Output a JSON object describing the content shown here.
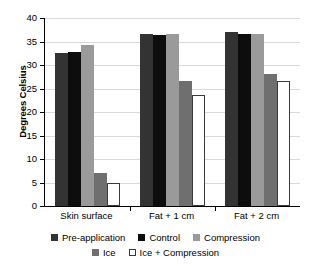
{
  "chart_data": {
    "type": "bar",
    "title": "",
    "xlabel": "",
    "ylabel": "Degrees Celsius",
    "ylim": [
      0,
      40
    ],
    "ytick_step": 5,
    "yticks": [
      40,
      35,
      30,
      25,
      20,
      15,
      10,
      5,
      0
    ],
    "grid": true,
    "legend_position": "bottom",
    "categories": [
      "Skin surface",
      "Fat + 1 cm",
      "Fat + 2 cm"
    ],
    "series": [
      {
        "name": "Pre-application",
        "color": "#333333",
        "values": [
          32.5,
          36.5,
          37.0
        ]
      },
      {
        "name": "Control",
        "color": "#0d0d0d",
        "values": [
          32.8,
          36.4,
          36.6
        ]
      },
      {
        "name": "Compression",
        "color": "#9a9a9a",
        "values": [
          34.3,
          36.6,
          36.6
        ]
      },
      {
        "name": "Ice",
        "color": "#6f6f6f",
        "values": [
          7.0,
          26.6,
          28.0
        ]
      },
      {
        "name": "Ice + Compression",
        "color": "#ffffff",
        "values": [
          4.8,
          23.6,
          26.5
        ]
      }
    ]
  }
}
